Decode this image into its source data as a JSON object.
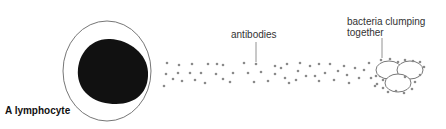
{
  "diagram": {
    "labels": {
      "lymphocyte": "A lymphocyte",
      "antibodies": "antibodies",
      "bacteria_line1": "bacteria clumping",
      "bacteria_line2": "together"
    },
    "colors": {
      "nucleus": "#111111",
      "cell_outline": "#666666",
      "antibody_dot": "#8a8a8a",
      "bacteria_outline": "#555555",
      "leader_line": "#777777"
    }
  }
}
